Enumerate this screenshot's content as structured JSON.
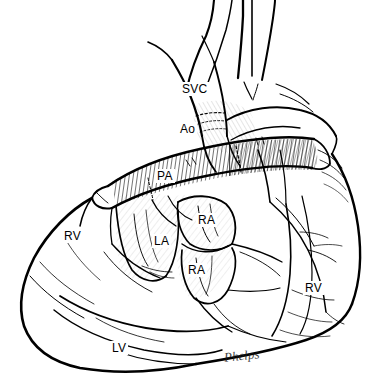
{
  "figure": {
    "width": 389,
    "height": 382,
    "background_color": "#ffffff",
    "ink_color": "#000000",
    "style": "black-and-white pen-and-ink medical line drawing with cross-hatch shading"
  },
  "labels": [
    {
      "id": "svc",
      "text": "SVC",
      "x": 180,
      "y": 82,
      "structure": "superior vena cava"
    },
    {
      "id": "ao",
      "text": "Ao",
      "x": 178,
      "y": 122,
      "structure": "aorta"
    },
    {
      "id": "pa",
      "text": "PA",
      "x": 155,
      "y": 169,
      "structure": "pulmonary artery conduit"
    },
    {
      "id": "ra-upper",
      "text": "RA",
      "x": 196,
      "y": 213,
      "structure": "right atrium"
    },
    {
      "id": "la",
      "text": "LA",
      "x": 152,
      "y": 234,
      "structure": "left atrium"
    },
    {
      "id": "ra-lower",
      "text": "RA",
      "x": 186,
      "y": 263,
      "structure": "right atrium"
    },
    {
      "id": "rv-left",
      "text": "RV",
      "x": 62,
      "y": 229,
      "structure": "right ventricle"
    },
    {
      "id": "rv-right",
      "text": "RV",
      "x": 303,
      "y": 281,
      "structure": "right ventricle"
    },
    {
      "id": "lv",
      "text": "LV",
      "x": 110,
      "y": 341,
      "structure": "left ventricle"
    }
  ],
  "signature": {
    "text": "Phelps",
    "x": 224,
    "y": 348,
    "description": "artist cursive signature at lower center-right"
  }
}
